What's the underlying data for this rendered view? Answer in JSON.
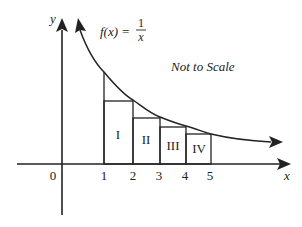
{
  "diagram": {
    "function_label": "f(x) =",
    "function_numerator": "1",
    "function_denominator": "x",
    "note": "Not to Scale",
    "axes": {
      "x_label": "x",
      "y_label": "y",
      "origin_label": "0",
      "x_ticks": [
        "1",
        "2",
        "3",
        "4",
        "5"
      ]
    },
    "regions": [
      {
        "label": "I",
        "from": 1,
        "to": 2
      },
      {
        "label": "II",
        "from": 2,
        "to": 3
      },
      {
        "label": "III",
        "from": 3,
        "to": 4
      },
      {
        "label": "IV",
        "from": 4,
        "to": 5
      }
    ],
    "colors": {
      "stroke": "#222222",
      "background": "#ffffff"
    }
  }
}
